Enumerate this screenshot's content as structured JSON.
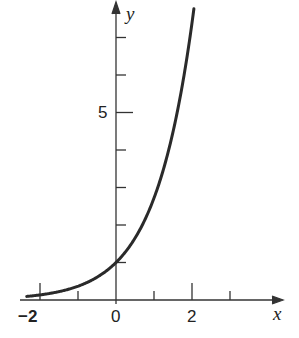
{
  "chart_data": {
    "type": "line",
    "title": "",
    "function": "y = e^x",
    "xlabel": "x",
    "ylabel": "y",
    "xlim": [
      -2.4,
      4.3
    ],
    "ylim": [
      0,
      8
    ],
    "x_ticks": [
      -2,
      -1,
      0,
      1,
      2,
      3
    ],
    "x_tick_labels": [
      "-2",
      "0",
      "2"
    ],
    "y_ticks": [
      1,
      2,
      3,
      4,
      5,
      6,
      7
    ],
    "y_tick_labels": [
      "5"
    ],
    "grid": false,
    "legend": null,
    "series": [
      {
        "name": "e^x",
        "x": [
          -2.35,
          -2,
          -1.5,
          -1,
          -0.5,
          0,
          0.5,
          1,
          1.5,
          2,
          2.06
        ],
        "y": [
          0.095,
          0.135,
          0.223,
          0.368,
          0.607,
          1.0,
          1.649,
          2.718,
          4.482,
          7.389,
          7.85
        ]
      }
    ]
  },
  "labels": {
    "x_axis": "x",
    "y_axis": "y",
    "tick_neg2": "−2",
    "tick_0": "0",
    "tick_2": "2",
    "tick_5": "5"
  }
}
